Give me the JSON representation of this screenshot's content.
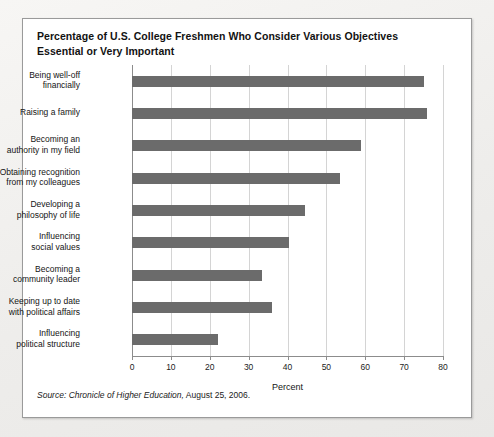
{
  "card": {
    "title": "Percentage of U.S. College Freshmen Who Consider Various Objectives Essential or Very Important",
    "source_italic": "Source: Chronicle of Higher Education,",
    "source_date": " August 25, 2006."
  },
  "chart_data": {
    "type": "bar",
    "orientation": "horizontal",
    "title": "Percentage of U.S. College Freshmen Who Consider Various Objectives Essential or Very Important",
    "xlabel": "Percent",
    "ylabel": "",
    "xlim": [
      0,
      80
    ],
    "xticks": [
      0,
      10,
      20,
      30,
      40,
      50,
      60,
      70,
      80
    ],
    "xtick_labels": [
      "0",
      "10",
      "20",
      "30",
      "40",
      "50",
      "60",
      "70",
      "80"
    ],
    "grid": "vertical",
    "legend": "none",
    "bar_color": "#6b6b6b",
    "categories": [
      "Being well-off\nfinancially",
      "Raising a family",
      "Becoming an\nauthority in my field",
      "Obtaining recognition\nfrom my colleagues",
      "Developing a\nphilosophy of life",
      "Influencing\nsocial values",
      "Becoming a\ncommunity leader",
      "Keeping up to date\nwith political affairs",
      "Influencing\npolitical structure"
    ],
    "values": [
      75,
      76,
      59,
      53.5,
      44.5,
      40.5,
      33.5,
      36,
      22
    ]
  }
}
